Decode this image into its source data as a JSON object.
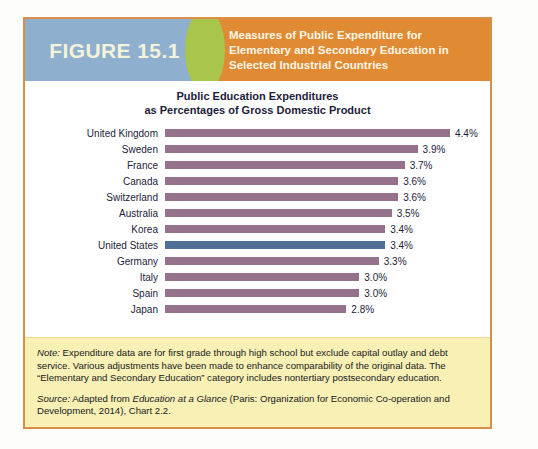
{
  "figure": {
    "badge_label": "FIGURE 15.1",
    "title": "Measures of Public Expenditure for Elementary and Secondary Education in Selected Industrial Countries",
    "colors": {
      "badge_bg": "#8fafce",
      "divider": "#a9c54b",
      "header_bg": "#e08a33",
      "frame_border": "#d98f48",
      "note_bg": "#f8f0b4",
      "bar": "#96718c",
      "bar_highlight": "#4f6f96"
    }
  },
  "chart_data": {
    "type": "bar",
    "orientation": "horizontal",
    "title": "Public Education Expenditures",
    "subtitle": "as Percentages of Gross Domestic Product",
    "title_line1": "Public Education Expenditures",
    "title_line2": "as Percentages of Gross Domestic Product",
    "xlabel": "",
    "ylabel": "",
    "xlim": [
      0,
      4.4
    ],
    "grid": false,
    "legend": "none",
    "unit": "%",
    "categories": [
      "United Kingdom",
      "Sweden",
      "France",
      "Canada",
      "Switzerland",
      "Australia",
      "Korea",
      "United States",
      "Germany",
      "Italy",
      "Spain",
      "Japan"
    ],
    "values": [
      4.4,
      3.9,
      3.7,
      3.6,
      3.6,
      3.5,
      3.4,
      3.4,
      3.3,
      3.0,
      3.0,
      2.8
    ],
    "labels": [
      "4.4%",
      "3.9%",
      "3.7%",
      "3.6%",
      "3.6%",
      "3.5%",
      "3.4%",
      "3.4%",
      "3.3%",
      "3.0%",
      "3.0%",
      "2.8%"
    ],
    "highlight_category": "United States",
    "bars": [
      {
        "category": "United Kingdom",
        "value": 4.4,
        "label": "4.4%",
        "highlight": false
      },
      {
        "category": "Sweden",
        "value": 3.9,
        "label": "3.9%",
        "highlight": false
      },
      {
        "category": "France",
        "value": 3.7,
        "label": "3.7%",
        "highlight": false
      },
      {
        "category": "Canada",
        "value": 3.6,
        "label": "3.6%",
        "highlight": false
      },
      {
        "category": "Switzerland",
        "value": 3.6,
        "label": "3.6%",
        "highlight": false
      },
      {
        "category": "Australia",
        "value": 3.5,
        "label": "3.5%",
        "highlight": false
      },
      {
        "category": "Korea",
        "value": 3.4,
        "label": "3.4%",
        "highlight": false
      },
      {
        "category": "United States",
        "value": 3.4,
        "label": "3.4%",
        "highlight": true
      },
      {
        "category": "Germany",
        "value": 3.3,
        "label": "3.3%",
        "highlight": false
      },
      {
        "category": "Italy",
        "value": 3.0,
        "label": "3.0%",
        "highlight": false
      },
      {
        "category": "Spain",
        "value": 3.0,
        "label": "3.0%",
        "highlight": false
      },
      {
        "category": "Japan",
        "value": 2.8,
        "label": "2.8%",
        "highlight": false
      }
    ]
  },
  "note": {
    "note_label": "Note:",
    "note_text": " Expenditure data are for first grade through high school but exclude capital outlay and debt service. Various adjustments have been made to enhance comparability of the original data. The “Elementary and Secondary Education” category includes nontertiary postsecondary education.",
    "source_label": "Source:",
    "source_text_before": " Adapted from ",
    "source_italic": "Education at a Glance",
    "source_text_after": " (Paris: Organization for Economic Co-operation and Development, 2014), Chart 2.2."
  }
}
